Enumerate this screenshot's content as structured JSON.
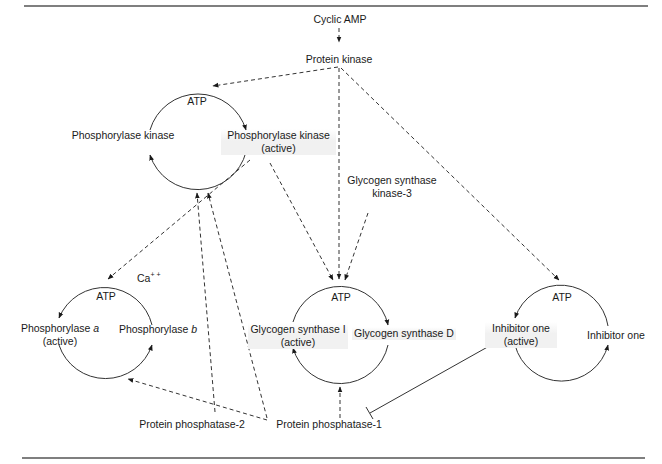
{
  "diagram": {
    "type": "signaling-pathway",
    "title": "",
    "rules": {
      "top_y": 6,
      "bottom_y": 458,
      "color": "#555555"
    },
    "labels": {
      "cyclic_amp": "Cyclic AMP",
      "protein_kinase": "Protein kinase",
      "gsk3_line1": "Glycogen synthase",
      "gsk3_line2": "kinase-3",
      "ca": "Ca",
      "ca_sup": "+ +",
      "pp2": "Protein phosphatase-2",
      "pp1": "Protein phosphatase-1"
    },
    "cycles": [
      {
        "id": "phosphorylase-kinase-cycle",
        "top_label": "ATP",
        "left_label": "Phosphorylase kinase",
        "right_line1": "Phosphorylase kinase",
        "right_line2": "(active)"
      },
      {
        "id": "phosphorylase-cycle",
        "top_label": "ATP",
        "left_line1_prefix": "Phosphorylase ",
        "left_line1_italic": "a",
        "left_line2": "(active)",
        "right_prefix": "Phosphorylase ",
        "right_italic": "b"
      },
      {
        "id": "glycogen-synthase-cycle",
        "top_label": "ATP",
        "left_line1": "Glycogen synthase I",
        "left_line2": "(active)",
        "right_label": "Glycogen synthase D"
      },
      {
        "id": "inhibitor-one-cycle",
        "top_label": "ATP",
        "left_line1": "Inhibitor one",
        "left_line2": "(active)",
        "right_label": "Inhibitor one"
      }
    ],
    "edges": [
      {
        "from": "Cyclic AMP",
        "to": "Protein kinase",
        "style": "dashed",
        "type": "activates"
      },
      {
        "from": "Protein kinase",
        "to": "Phosphorylase kinase cycle",
        "style": "dashed",
        "type": "activates"
      },
      {
        "from": "Protein kinase",
        "to": "Glycogen synthase cycle",
        "style": "dashed",
        "type": "activates"
      },
      {
        "from": "Protein kinase",
        "to": "Inhibitor one cycle",
        "style": "dashed",
        "type": "activates"
      },
      {
        "from": "Phosphorylase kinase (active)",
        "to": "Phosphorylase cycle",
        "style": "dashed",
        "type": "activates"
      },
      {
        "from": "Phosphorylase kinase (active)",
        "to": "Glycogen synthase cycle",
        "style": "dashed",
        "type": "activates"
      },
      {
        "from": "Glycogen synthase kinase-3",
        "to": "Glycogen synthase cycle",
        "style": "dashed",
        "type": "activates"
      },
      {
        "from": "Protein phosphatase-2",
        "to": "Phosphorylase kinase cycle",
        "style": "dashed",
        "type": "activates"
      },
      {
        "from": "Protein phosphatase-1",
        "to": "Phosphorylase kinase cycle",
        "style": "dashed",
        "type": "activates"
      },
      {
        "from": "Protein phosphatase-1",
        "to": "Phosphorylase cycle",
        "style": "dashed",
        "type": "activates"
      },
      {
        "from": "Protein phosphatase-1",
        "to": "Glycogen synthase cycle",
        "style": "dashed",
        "type": "activates"
      },
      {
        "from": "Inhibitor one (active)",
        "to": "Protein phosphatase-1",
        "style": "solid",
        "type": "inhibits"
      }
    ]
  }
}
